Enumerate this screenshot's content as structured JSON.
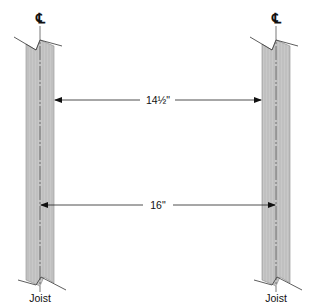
{
  "diagram": {
    "centerline_symbol": "℄",
    "joists": [
      {
        "label": "Joist",
        "left": 26,
        "right": 54,
        "center": 40
      },
      {
        "label": "Joist",
        "left": 262,
        "right": 290,
        "center": 276
      }
    ],
    "dimensions": [
      {
        "label": "14½\"",
        "meaning": "clear space between joists",
        "from_x": 54,
        "to_x": 262,
        "y": 100
      },
      {
        "label": "16\"",
        "meaning": "on-center spacing",
        "from_x": 40,
        "to_x": 276,
        "y": 205
      }
    ],
    "colors": {
      "joist_fill": "#c4c4c4",
      "joist_edge": "#8a8a8a",
      "line": "#222222",
      "centerline": "#555555"
    }
  }
}
